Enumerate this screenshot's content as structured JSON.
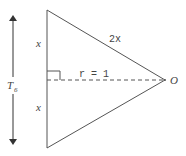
{
  "diagram": {
    "type": "geometry-triangle",
    "labels": {
      "side_top": "x",
      "side_bottom": "x",
      "hypotenuse": "2x",
      "radius": "r = 1",
      "center": "O",
      "total_side_main": "T",
      "total_side_sub": "6"
    },
    "colors": {
      "stroke": "#555555",
      "text": "#444444"
    }
  }
}
